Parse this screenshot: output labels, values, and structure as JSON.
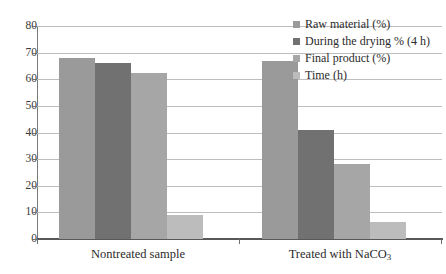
{
  "chart_data": {
    "type": "bar",
    "title": "",
    "subtitle": "",
    "xlabel": "",
    "ylabel": "",
    "ylim": [
      0,
      80
    ],
    "ytick_step": 10,
    "yticks": [
      "80",
      "70",
      "60",
      "50",
      "40",
      "30",
      "20",
      "10",
      "0"
    ],
    "grid": true,
    "grid_axis": "y",
    "legend_position": "top-right",
    "categories": [
      "Nontreated sample",
      "Treated with NaCO3"
    ],
    "categories_display": [
      {
        "pre": "Nontreated sample",
        "sub": "",
        "post": ""
      },
      {
        "pre": "Treated with NaCO",
        "sub": "3",
        "post": ""
      }
    ],
    "series": [
      {
        "name": "Raw material (%)",
        "color": "#9a9a9a",
        "values": [
          68,
          67
        ]
      },
      {
        "name": "During the drying % (4 h)",
        "color": "#717171",
        "values": [
          66,
          41
        ]
      },
      {
        "name": "Final product (%)",
        "color": "#a6a6a6",
        "values": [
          62.5,
          28
        ]
      },
      {
        "name": "Time (h)",
        "color": "#bcbcbc",
        "values": [
          9,
          6.5
        ]
      }
    ]
  },
  "legend": {
    "items": [
      {
        "label": "Raw material (%)",
        "color": "#9a9a9a"
      },
      {
        "label": "During the drying % (4 h)",
        "color": "#717171"
      },
      {
        "label": "Final product (%)",
        "color": "#a6a6a6"
      },
      {
        "label": "Time (h)",
        "color": "#bcbcbc"
      }
    ]
  }
}
